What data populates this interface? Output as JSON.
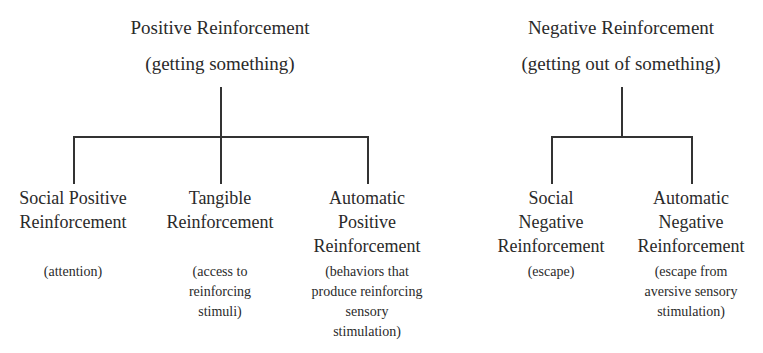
{
  "trees": [
    {
      "title": "Positive Reinforcement",
      "subtitle": "(getting something)",
      "children": [
        {
          "label_lines": [
            "Social Positive",
            "Reinforcement"
          ],
          "desc_lines": [
            "(attention)"
          ]
        },
        {
          "label_lines": [
            "Tangible",
            "Reinforcement"
          ],
          "desc_lines": [
            "(access to",
            "reinforcing",
            "stimuli)"
          ]
        },
        {
          "label_lines": [
            "Automatic",
            "Positive",
            "Reinforcement"
          ],
          "desc_lines": [
            "(behaviors that",
            "produce reinforcing",
            "sensory",
            "stimulation)"
          ]
        }
      ]
    },
    {
      "title": "Negative Reinforcement",
      "subtitle": "(getting out of something)",
      "children": [
        {
          "label_lines": [
            "Social",
            "Negative",
            "Reinforcement"
          ],
          "desc_lines": [
            "(escape)"
          ]
        },
        {
          "label_lines": [
            "Automatic",
            "Negative",
            "Reinforcement"
          ],
          "desc_lines": [
            "(escape from",
            "aversive sensory",
            "stimulation)"
          ]
        }
      ]
    }
  ],
  "colors": {
    "line": "#333333",
    "text": "#2a2a2a",
    "background": "#ffffff"
  }
}
